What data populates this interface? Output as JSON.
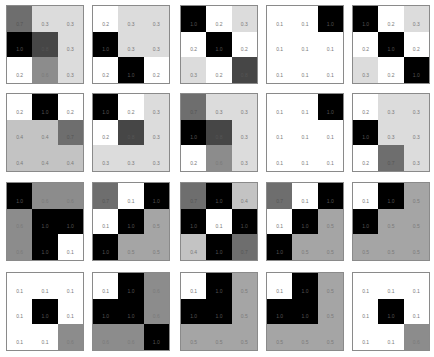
{
  "chart_data": {
    "type": "heatmap",
    "title": "",
    "layout": {
      "rows": 4,
      "cols": 5,
      "grid_per_tile": [
        3,
        3
      ]
    },
    "colormap": "grayscale (low=white, high=black)",
    "tiles": [
      {
        "values": [
          [
            0.7,
            0.3,
            0.3
          ],
          [
            1.0,
            0.8,
            0.3
          ],
          [
            0.2,
            0.6,
            0.3
          ]
        ]
      },
      {
        "values": [
          [
            0.2,
            0.3,
            0.3
          ],
          [
            1.0,
            0.3,
            0.3
          ],
          [
            0.2,
            1.0,
            0.2
          ]
        ]
      },
      {
        "values": [
          [
            1.0,
            0.2,
            0.3
          ],
          [
            0.2,
            1.0,
            0.2
          ],
          [
            0.3,
            0.2,
            0.8
          ]
        ]
      },
      {
        "values": [
          [
            0.1,
            0.1,
            1.0
          ],
          [
            0.1,
            0.1,
            0.1
          ],
          [
            0.1,
            0.1,
            0.1
          ]
        ]
      },
      {
        "values": [
          [
            1.0,
            0.2,
            0.3
          ],
          [
            0.2,
            1.0,
            0.2
          ],
          [
            0.3,
            0.2,
            1.0
          ]
        ]
      },
      {
        "values": [
          [
            0.2,
            1.0,
            0.2
          ],
          [
            0.4,
            0.4,
            0.7
          ],
          [
            0.4,
            0.4,
            0.4
          ]
        ]
      },
      {
        "values": [
          [
            1.0,
            0.2,
            0.3
          ],
          [
            0.2,
            0.8,
            0.3
          ],
          [
            0.3,
            0.3,
            0.3
          ]
        ]
      },
      {
        "values": [
          [
            0.7,
            0.3,
            0.3
          ],
          [
            1.0,
            0.8,
            0.3
          ],
          [
            0.2,
            0.6,
            0.3
          ]
        ]
      },
      {
        "values": [
          [
            0.1,
            0.1,
            1.0
          ],
          [
            0.1,
            0.1,
            0.1
          ],
          [
            0.1,
            0.1,
            0.1
          ]
        ]
      },
      {
        "values": [
          [
            0.2,
            0.3,
            0.3
          ],
          [
            1.0,
            0.3,
            0.3
          ],
          [
            0.2,
            0.7,
            0.3
          ]
        ]
      },
      {
        "values": [
          [
            1.0,
            0.6,
            0.6
          ],
          [
            0.6,
            1.0,
            1.0
          ],
          [
            0.6,
            1.0,
            0.1
          ]
        ]
      },
      {
        "values": [
          [
            0.7,
            0.1,
            1.0
          ],
          [
            0.1,
            1.0,
            0.5
          ],
          [
            1.0,
            0.5,
            0.5
          ]
        ]
      },
      {
        "values": [
          [
            0.7,
            1.0,
            0.4
          ],
          [
            1.0,
            0.1,
            1.0
          ],
          [
            0.4,
            1.0,
            0.7
          ]
        ]
      },
      {
        "values": [
          [
            0.7,
            0.1,
            1.0
          ],
          [
            0.1,
            1.0,
            0.5
          ],
          [
            1.0,
            0.5,
            0.5
          ]
        ]
      },
      {
        "values": [
          [
            0.1,
            1.0,
            0.5
          ],
          [
            1.0,
            0.5,
            0.5
          ],
          [
            0.5,
            0.5,
            0.5
          ]
        ]
      },
      {
        "values": [
          [
            0.1,
            0.1,
            0.1
          ],
          [
            0.1,
            1.0,
            0.1
          ],
          [
            0.1,
            0.1,
            0.6
          ]
        ]
      },
      {
        "values": [
          [
            0.1,
            1.0,
            0.6
          ],
          [
            1.0,
            1.0,
            0.6
          ],
          [
            0.6,
            0.6,
            1.0
          ]
        ]
      },
      {
        "values": [
          [
            0.1,
            1.0,
            0.5
          ],
          [
            1.0,
            1.0,
            0.5
          ],
          [
            0.5,
            0.5,
            0.5
          ]
        ]
      },
      {
        "values": [
          [
            0.1,
            1.0,
            0.5
          ],
          [
            1.0,
            1.0,
            0.5
          ],
          [
            0.5,
            0.5,
            0.5
          ]
        ]
      },
      {
        "values": [
          [
            0.1,
            0.1,
            0.1
          ],
          [
            0.1,
            1.0,
            0.1
          ],
          [
            0.1,
            0.1,
            0.6
          ]
        ]
      }
    ],
    "tile_positions": {
      "x": [
        6,
        92,
        180,
        266,
        352
      ],
      "y": [
        5,
        93,
        182,
        272
      ]
    }
  }
}
